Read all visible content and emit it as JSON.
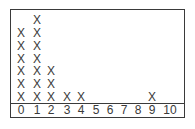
{
  "chart_data": {
    "type": "dot_plot",
    "title": "",
    "xlabel": "",
    "ylabel": "",
    "marker": "X",
    "categories": [
      "0",
      "1",
      "2",
      "3",
      "4",
      "5",
      "6",
      "7",
      "8",
      "9",
      "10"
    ],
    "values": [
      6,
      7,
      3,
      1,
      1,
      0,
      0,
      0,
      0,
      1,
      0
    ],
    "xlim": [
      0,
      10
    ],
    "grid": false,
    "legend": null
  },
  "axis": {
    "ticks": [
      "0",
      "1",
      "2",
      "3",
      "4",
      "5",
      "6",
      "7",
      "8",
      "9",
      "10"
    ]
  },
  "colors": {
    "ink": "#3a3a3a",
    "background": "#ffffff"
  }
}
